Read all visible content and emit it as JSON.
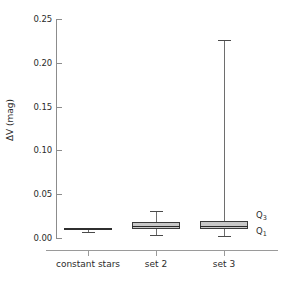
{
  "chart_data": {
    "type": "box",
    "title": "",
    "xlabel": "",
    "ylabel": "ΔV (mag)",
    "ylim": [
      0.0,
      0.25
    ],
    "yticks": [
      0.0,
      0.05,
      0.1,
      0.15,
      0.2,
      0.25
    ],
    "ytick_labels": [
      "0.00",
      "0.05",
      "0.10",
      "0.15",
      "0.20",
      "0.25"
    ],
    "grid": false,
    "legend": null,
    "categories": [
      "constant stars",
      "set 2",
      "set 3"
    ],
    "boxes": [
      {
        "name": "constant stars",
        "whisker_low": 0.007,
        "q1": 0.0095,
        "median": 0.0103,
        "q3": 0.0112,
        "whisker_high": 0.0115
      },
      {
        "name": "set 2",
        "whisker_low": 0.003,
        "q1": 0.0098,
        "median": 0.0138,
        "q3": 0.0183,
        "whisker_high": 0.0312
      },
      {
        "name": "set 3",
        "whisker_low": 0.002,
        "q1": 0.0098,
        "median": 0.014,
        "q3": 0.0192,
        "whisker_high": 0.2258
      }
    ],
    "annotations": [
      {
        "text": "Q3",
        "label_main": "Q",
        "label_sub": "3",
        "target": "set 3 upper quartile"
      },
      {
        "text": "Q1",
        "label_main": "Q",
        "label_sub": "1",
        "target": "set 3 lower quartile"
      }
    ],
    "colors": {
      "box_fill": "#c8c8c8",
      "box_edge": "#3a3a3a",
      "median": "#2a2a2a",
      "whisker": "#6e6e6e",
      "axis": "#8c8c8c",
      "text": "#2b2b2b",
      "background": "#ffffff"
    }
  }
}
